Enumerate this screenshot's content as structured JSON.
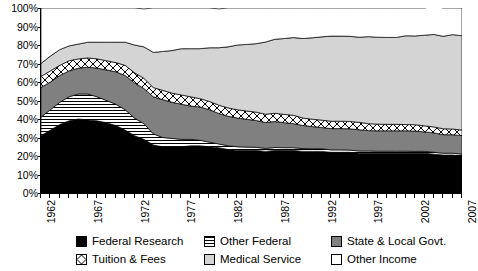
{
  "chart_data": {
    "type": "area",
    "stacked": true,
    "normalized_percent": true,
    "title": "",
    "xlabel": "",
    "ylabel": "",
    "ylim": [
      0,
      100
    ],
    "ytick_labels": [
      "0%",
      "10%",
      "20%",
      "30%",
      "40%",
      "50%",
      "60%",
      "70%",
      "80%",
      "90%",
      "100%"
    ],
    "ytick_values": [
      0,
      10,
      20,
      30,
      40,
      50,
      60,
      70,
      80,
      90,
      100
    ],
    "grid": false,
    "legend_position": "bottom",
    "xtick_labels": [
      "1962",
      "1967",
      "1972",
      "1977",
      "1982",
      "1987",
      "1992",
      "1997",
      "2002",
      "2007"
    ],
    "xtick_values": [
      1962,
      1967,
      1972,
      1977,
      1982,
      1987,
      1992,
      1997,
      2002,
      2007
    ],
    "x": [
      1962,
      1963,
      1964,
      1965,
      1966,
      1967,
      1968,
      1969,
      1970,
      1971,
      1972,
      1973,
      1974,
      1975,
      1976,
      1977,
      1978,
      1979,
      1980,
      1981,
      1982,
      1983,
      1984,
      1985,
      1986,
      1987,
      1988,
      1989,
      1990,
      1991,
      1992,
      1993,
      1994,
      1995,
      1996,
      1997,
      1998,
      1999,
      2000,
      2001,
      2002,
      2003,
      2004,
      2005,
      2006,
      2007
    ],
    "series": [
      {
        "name": "Federal Research",
        "color": "#000000",
        "pattern": "solid",
        "values": [
          31,
          34,
          37,
          39,
          40,
          39.5,
          39,
          38,
          36.5,
          34,
          31,
          29,
          26,
          25,
          25,
          25,
          25.5,
          25.5,
          25,
          24.5,
          23.5,
          23,
          23,
          23,
          22.5,
          23,
          23,
          23,
          22.5,
          22.5,
          22.5,
          22,
          22,
          22,
          21.5,
          21.5,
          21.5,
          21.5,
          21.5,
          21.5,
          21.5,
          21.5,
          21,
          20.5,
          20.5,
          20
        ]
      },
      {
        "name": "Other Federal",
        "color": "#ffffff",
        "pattern": "horizontal-stripes",
        "values": [
          10,
          11,
          12,
          13,
          13.5,
          14,
          13,
          12,
          11.5,
          11,
          9.5,
          8.5,
          6,
          5,
          4.5,
          4,
          3.5,
          3,
          2.5,
          2,
          2,
          2,
          1.8,
          1.7,
          1.6,
          1.6,
          1.5,
          1.5,
          1.5,
          1.4,
          1.4,
          1.3,
          1.3,
          1.2,
          1.2,
          1.2,
          1.1,
          1.1,
          1.1,
          1.1,
          1,
          1,
          1,
          1,
          1,
          1
        ]
      },
      {
        "name": "State & Local Govt.",
        "color": "#808080",
        "pattern": "solid",
        "values": [
          16,
          15,
          14.5,
          14,
          14,
          14.5,
          15.5,
          16.5,
          17.5,
          18.5,
          19,
          19,
          20,
          20.5,
          19.5,
          19,
          18,
          18,
          17.5,
          16.5,
          16,
          15.5,
          15,
          14.5,
          14,
          14,
          13.5,
          13,
          12.5,
          12,
          11.5,
          11.5,
          11.5,
          11.5,
          11.5,
          11,
          11,
          11,
          11,
          11,
          11,
          10.5,
          10.5,
          10,
          10,
          10
        ]
      },
      {
        "name": "Tuition & Fees",
        "color": "#ffffff",
        "pattern": "diamond-crosshatch",
        "values": [
          6,
          6,
          5.5,
          5.5,
          5,
          5,
          5,
          5,
          5,
          5.5,
          5.5,
          5.5,
          5,
          5,
          5,
          5,
          5,
          4.5,
          4.5,
          4.5,
          4.5,
          4.5,
          4.5,
          4.5,
          4.5,
          4.5,
          4.5,
          4.5,
          4,
          4,
          4,
          4,
          4,
          4,
          4,
          3.8,
          3.6,
          3.5,
          3.5,
          3.4,
          3.4,
          3.3,
          3.2,
          3.2,
          3.1,
          3
        ]
      },
      {
        "name": "Medical Service",
        "color": "#d4d4d4",
        "pattern": "solid",
        "values": [
          7,
          8,
          8.5,
          8,
          8,
          8.5,
          9,
          10,
          11,
          12.5,
          15,
          17,
          19,
          21,
          23,
          25,
          26,
          27,
          29,
          31,
          33,
          35,
          36,
          37,
          39,
          40,
          41,
          42,
          43,
          44,
          45,
          46,
          46,
          46,
          46,
          47,
          47,
          47,
          47,
          48,
          48,
          49,
          50,
          50,
          51,
          51
        ]
      },
      {
        "name": "Other Income",
        "color": "#ffffff",
        "pattern": "solid",
        "values": [
          30,
          26,
          22.5,
          20.5,
          19.5,
          18.5,
          18.5,
          18.5,
          18.5,
          18.5,
          20,
          20.5,
          24,
          23.5,
          23,
          22,
          22,
          22,
          21.5,
          21,
          21,
          20,
          19.7,
          19.3,
          18.4,
          16.9,
          16.5,
          16,
          16.5,
          16.1,
          15.6,
          15.2,
          15.2,
          15.3,
          15.8,
          15.5,
          15.8,
          15.9,
          15.9,
          15,
          15.1,
          14.7,
          15.3,
          15.3,
          14.4,
          15
        ]
      }
    ]
  },
  "legend": {
    "items": [
      {
        "label": "Federal Research",
        "key": "federal-research"
      },
      {
        "label": "Other Federal",
        "key": "other-federal"
      },
      {
        "label": "State & Local Govt.",
        "key": "state-local-govt"
      },
      {
        "label": "Tuition & Fees",
        "key": "tuition-fees"
      },
      {
        "label": "Medical Service",
        "key": "medical-service"
      },
      {
        "label": "Other Income",
        "key": "other-income"
      }
    ]
  }
}
